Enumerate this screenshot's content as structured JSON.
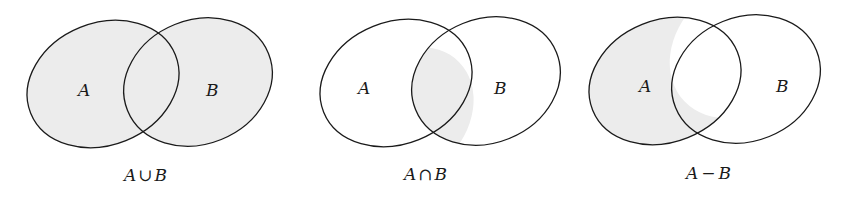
{
  "colors": {
    "stroke": "#1a1a1a",
    "shade": "#ececec",
    "background": "#ffffff"
  },
  "diagrams": [
    {
      "set_a_label": "A",
      "set_b_label": "B",
      "caption_left": "A",
      "caption_op": "∪",
      "caption_right": "B",
      "shaded_region": "union"
    },
    {
      "set_a_label": "A",
      "set_b_label": "B",
      "caption_left": "A",
      "caption_op": "∩",
      "caption_right": "B",
      "shaded_region": "intersection"
    },
    {
      "set_a_label": "A",
      "set_b_label": "B",
      "caption_left": "A",
      "caption_op": "−",
      "caption_right": "B",
      "shaded_region": "difference A minus B"
    }
  ]
}
